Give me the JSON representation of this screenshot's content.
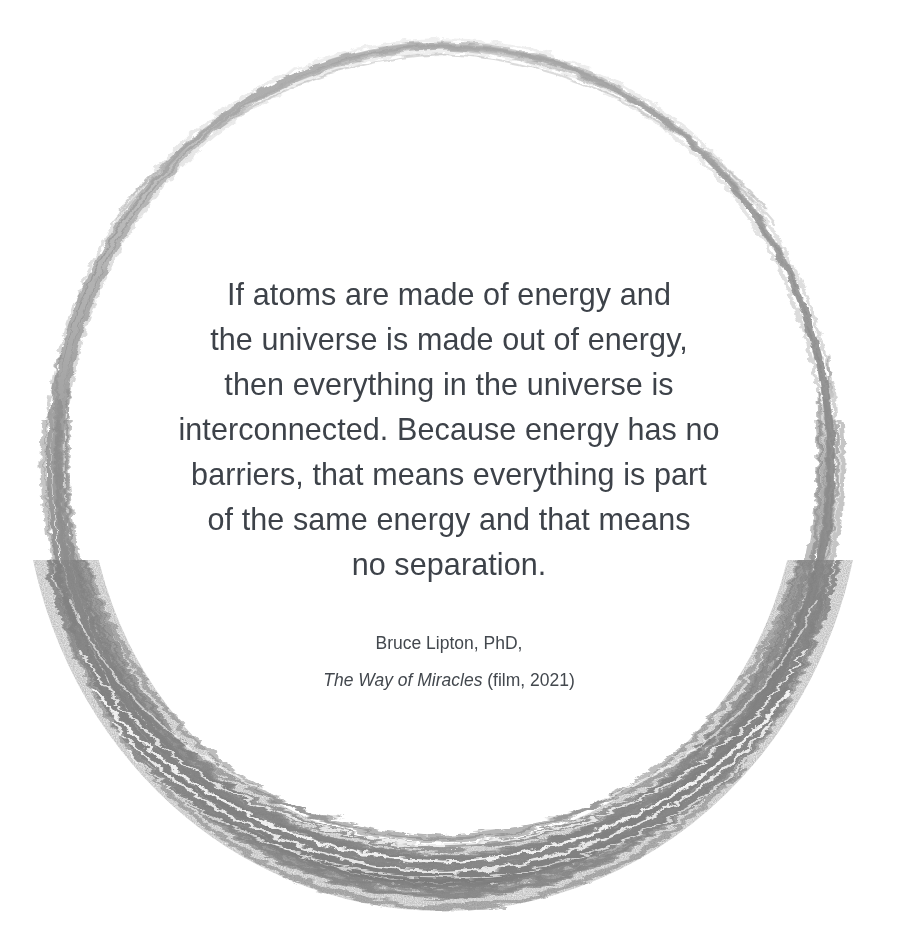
{
  "canvas": {
    "width": 898,
    "height": 951,
    "background_color": "#ffffff"
  },
  "decoration": {
    "shape_name": "hand-drawn-circle",
    "stroke_color": "#8a8a8a",
    "description": "sketchy multi-pass pencil circle, thin at top, thick at bottom",
    "center_x": 443,
    "center_y": 462,
    "radius_x": 388,
    "radius_y": 417
  },
  "quote": {
    "text_color": "#3d4249",
    "lines": [
      "If atoms are made of energy and",
      "the universe is made out of energy,",
      "then everything in the universe is",
      "interconnected. Because energy has no",
      "barriers, that means everything is part",
      "of the same energy and that means",
      "no separation."
    ],
    "full_text": "If atoms are made of energy and the universe is made out of energy, then everything in the universe is interconnected. Because energy has no barriers, that means everything is part of the same energy and that means no separation."
  },
  "attribution": {
    "text_color": "#43484e",
    "author": "Bruce Lipton, PhD,",
    "source_title": "The Way of Miracles",
    "source_suffix": " (film, 2021)",
    "source_medium": "film",
    "source_year": "2021"
  }
}
